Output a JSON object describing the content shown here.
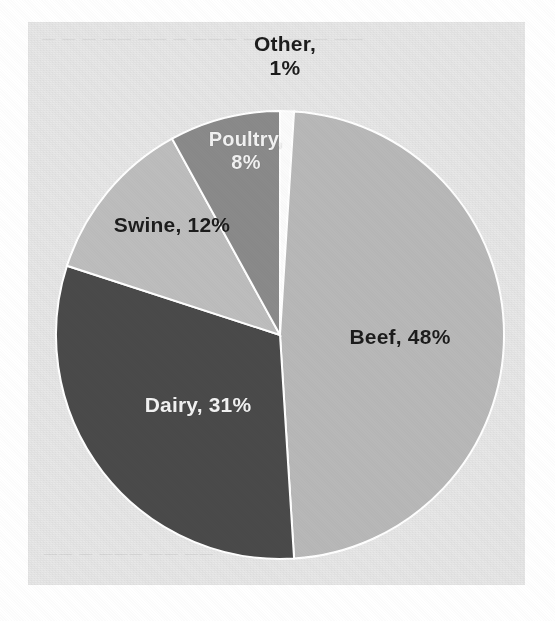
{
  "page": {
    "background_color": "#ffffff",
    "scan_background_color": "#e8e8e8",
    "bleed_text_top": "— — —  —— ——  — ———  —— —— — ——",
    "bleed_text_bottom": "—— — ———  —— ——"
  },
  "chart_data": {
    "type": "pie",
    "title": "",
    "subtitle": "",
    "xlabel": "",
    "ylabel": "",
    "grid": false,
    "legend_position": "none",
    "labels_inside": true,
    "units": "percent",
    "start_angle_deg": 0,
    "direction": "clockwise",
    "categories": [
      "Other",
      "Beef",
      "Dairy",
      "Swine",
      "Poultry"
    ],
    "values": [
      1,
      48,
      31,
      12,
      8
    ],
    "total": 100,
    "slices": [
      {
        "name": "Other",
        "value": 1,
        "display_label": "Other,",
        "display_label_line2": "1%",
        "color": "#fbfbfb",
        "label_color": "#1c1c1c",
        "label_placement": "outside-top"
      },
      {
        "name": "Beef",
        "value": 48,
        "display_label": "Beef, 48%",
        "display_label_line2": "",
        "color": "#b8b8b8",
        "label_color": "#1c1c1c",
        "label_placement": "inside-right"
      },
      {
        "name": "Dairy",
        "value": 31,
        "display_label": "Dairy, 31%",
        "display_label_line2": "",
        "color": "#4a4a4a",
        "label_color": "#f2f2f2",
        "label_placement": "inside-lower-left"
      },
      {
        "name": "Swine",
        "value": 12,
        "display_label": "Swine, 12%",
        "display_label_line2": "",
        "color": "#bdbdbd",
        "label_color": "#1c1c1c",
        "label_placement": "inside-upper-left"
      },
      {
        "name": "Poultry",
        "value": 8,
        "display_label": "Poultry,",
        "display_label_line2": "8%",
        "color": "#8a8a8a",
        "label_color": "#f2f2f2",
        "label_placement": "inside-upper"
      }
    ]
  },
  "geometry": {
    "center_x": 280,
    "center_y": 335,
    "radius": 224
  }
}
